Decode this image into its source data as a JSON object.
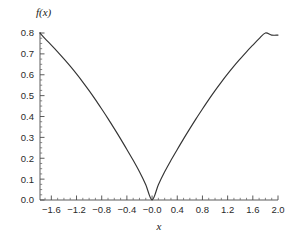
{
  "figure": {
    "background_color": "#ffffff",
    "curve_color": "#333333",
    "axis_color": "#4a4a4a",
    "text_color": "#2a2a2a"
  },
  "labels": {
    "y_axis_title": "f(x)",
    "x_axis_title": "x"
  },
  "chart_data": {
    "type": "line",
    "title": "",
    "xlabel": "x",
    "ylabel": "f(x)",
    "xlim": [
      -1.78,
      2.0
    ],
    "ylim": [
      0.0,
      0.8
    ],
    "grid": false,
    "legend": "none",
    "x_ticks": [
      -1.6,
      -1.2,
      -0.8,
      -0.4,
      -0.0,
      0.4,
      0.8,
      1.2,
      1.6,
      2.0
    ],
    "x_tick_labels": [
      "-1.6",
      "-1.2",
      "-0.8",
      "-0.4",
      "-0.0",
      "0.4",
      "0.8",
      "1.2",
      "1.6",
      "2.0"
    ],
    "x_minor_tick_step": 0.1,
    "y_ticks": [
      0.0,
      0.1,
      0.2,
      0.3,
      0.4,
      0.5,
      0.6,
      0.7,
      0.8
    ],
    "y_tick_labels": [
      "0.0",
      "0.1",
      "0.2",
      "0.3",
      "0.4",
      "0.5",
      "0.6",
      "0.7",
      "0.8"
    ],
    "y_minor_tick_step": 0.025,
    "series": [
      {
        "name": "f(x)",
        "color": "#333333",
        "x": [
          -1.78,
          -1.7,
          -1.6,
          -1.5,
          -1.4,
          -1.3,
          -1.2,
          -1.1,
          -1.0,
          -0.9,
          -0.8,
          -0.7,
          -0.6,
          -0.5,
          -0.4,
          -0.3,
          -0.2,
          -0.1,
          0.0,
          0.1,
          0.2,
          0.3,
          0.4,
          0.5,
          0.6,
          0.7,
          0.8,
          0.9,
          1.0,
          1.1,
          1.2,
          1.3,
          1.4,
          1.5,
          1.6,
          1.7,
          1.8,
          1.9,
          2.0
        ],
        "y": [
          0.8,
          0.773,
          0.742,
          0.71,
          0.676,
          0.641,
          0.604,
          0.565,
          0.524,
          0.481,
          0.436,
          0.39,
          0.342,
          0.293,
          0.242,
          0.19,
          0.135,
          0.073,
          0.0,
          0.073,
          0.135,
          0.19,
          0.242,
          0.293,
          0.342,
          0.39,
          0.436,
          0.481,
          0.524,
          0.565,
          0.604,
          0.641,
          0.676,
          0.71,
          0.742,
          0.773,
          0.8,
          0.79,
          0.79
        ]
      }
    ],
    "annotations": []
  },
  "geometry": {
    "plot_left_px": 40,
    "plot_right_px": 278,
    "plot_top_px": 33,
    "plot_bottom_px": 200
  }
}
